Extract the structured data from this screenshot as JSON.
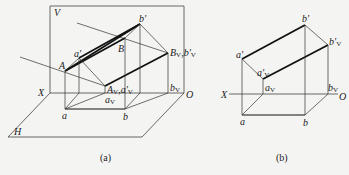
{
  "figure_a": {
    "caption": "(a)",
    "labels": {
      "V": "V",
      "H": "H",
      "X": "X",
      "O": "O",
      "A": "A",
      "B": "B",
      "a_prime": "a'",
      "b_prime": "b'",
      "a": "a",
      "b": "b",
      "AV_main": "A",
      "AV_sub": "V",
      "AV_sep": ",",
      "aprimeV_main": "a'",
      "aprimeV_sub": "V",
      "BV_main": "B",
      "BV_sub": "V",
      "BV_sep": ",",
      "bprimeV_main": "b'",
      "bprimeV_sub": "V",
      "aV_main": "a",
      "aV_sub": "V",
      "bV_main": "b",
      "bV_sub": "V"
    }
  },
  "figure_b": {
    "caption": "(b)",
    "labels": {
      "X": "X",
      "O": "O",
      "a_prime": "a'",
      "b_prime": "b'",
      "a": "a",
      "b": "b",
      "aprimeV_main": "a'",
      "aprimeV_sub": "V",
      "bprimeV_main": "b'",
      "bprimeV_sub": "V",
      "aV_main": "a",
      "aV_sub": "V",
      "bV_main": "b",
      "bV_sub": "V"
    }
  }
}
